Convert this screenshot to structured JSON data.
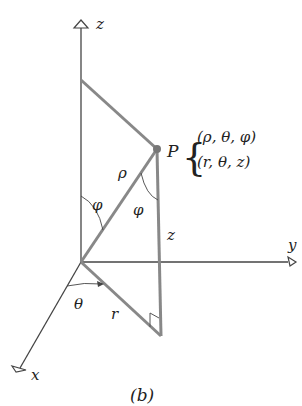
{
  "diagram": {
    "caption": "(b)",
    "axes": {
      "z": {
        "label": "z"
      },
      "y": {
        "label": "y"
      },
      "x": {
        "label": "x"
      }
    },
    "point": {
      "label": "P",
      "spherical": "(ρ, θ, φ)",
      "cylindrical": "(r, θ, z)"
    },
    "segment_labels": {
      "rho": "ρ",
      "r": "r",
      "z": "z"
    },
    "angle_labels": {
      "phi_at_origin": "φ",
      "phi_at_P": "φ",
      "theta": "θ"
    },
    "colors": {
      "axis": "#444444",
      "thick_line": "#888888",
      "point": "#777777",
      "text": "#222222"
    }
  }
}
